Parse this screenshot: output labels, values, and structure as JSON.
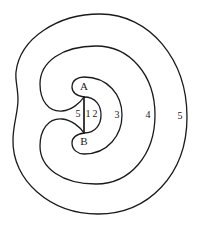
{
  "diagram": {
    "points": [
      {
        "id": "A",
        "label": "A"
      },
      {
        "id": "B",
        "label": "B"
      }
    ],
    "region_labels": {
      "left_of_segment": "5",
      "right_of_segment": "1",
      "inner_half_disk": "2",
      "inner_ring": "3",
      "middle_ring": "4",
      "outer_ring": "5"
    },
    "colors": {
      "stroke": "#1a1a1a",
      "background": "#ffffff"
    }
  }
}
